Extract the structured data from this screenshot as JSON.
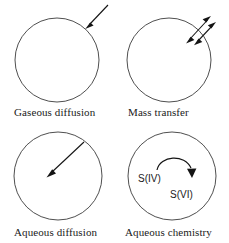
{
  "figure": {
    "background_color": "#ffffff",
    "stroke_color": "#3b3b3b",
    "arrow_color": "#141414",
    "panels": [
      {
        "id": "gaseous-diffusion",
        "caption": "Gaseous diffusion",
        "droplet": {
          "cx": 57,
          "cy": 60,
          "r": 42
        },
        "arrows": [
          {
            "name": "inbound-gas-arrow",
            "type": "single",
            "x1": 108,
            "y1": 5,
            "x2": 86,
            "y2": 28
          }
        ],
        "species_labels": []
      },
      {
        "id": "mass-transfer",
        "caption": "Mass transfer",
        "droplet": {
          "cx": 169,
          "cy": 60,
          "r": 42
        },
        "arrows": [
          {
            "name": "mass-transfer-arrow-a",
            "type": "double",
            "x1": 186,
            "y1": 43,
            "x2": 211,
            "y2": 16
          },
          {
            "name": "mass-transfer-arrow-b",
            "type": "double",
            "x1": 194,
            "y1": 45,
            "x2": 216,
            "y2": 22
          }
        ],
        "species_labels": []
      },
      {
        "id": "aqueous-diffusion",
        "caption": "Aqueous diffusion",
        "droplet": {
          "cx": 58,
          "cy": 176,
          "r": 44
        },
        "arrows": [
          {
            "name": "inward-aqueous-arrow",
            "type": "single",
            "x1": 84,
            "y1": 142,
            "x2": 47,
            "y2": 177
          }
        ],
        "species_labels": []
      },
      {
        "id": "aqueous-chemistry",
        "caption": "Aqueous chemistry",
        "droplet": {
          "cx": 172,
          "cy": 176,
          "r": 44
        },
        "arrows": [
          {
            "name": "oxidation-arc-arrow",
            "type": "arc",
            "x1": 157,
            "y1": 170,
            "x2": 192,
            "y2": 174
          }
        ],
        "species_labels": [
          {
            "name": "species-label-s4",
            "text": "S(IV)",
            "x": 138,
            "y": 182
          },
          {
            "name": "species-label-s6",
            "text": "S(VI)",
            "x": 170,
            "y": 198
          }
        ]
      }
    ]
  }
}
